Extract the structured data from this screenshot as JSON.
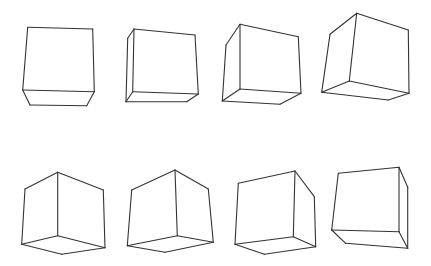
{
  "figure": {
    "background": "#ffffff",
    "line_color": "#333333",
    "rows": 2,
    "columns": 4
  },
  "cubes": [
    {
      "id": 1,
      "row": 1,
      "col": 1,
      "edges": [
        [
          [
            27.7,
            27.3
          ],
          [
            92.7,
            29
          ]
        ],
        [
          [
            27.7,
            27.3
          ],
          [
            22.7,
            90
          ]
        ],
        [
          [
            92.7,
            29
          ],
          [
            94.3,
            91.7
          ]
        ],
        [
          [
            22.7,
            90
          ],
          [
            94.3,
            91.7
          ]
        ],
        [
          [
            22.7,
            90
          ],
          [
            30,
            105
          ]
        ],
        [
          [
            94.3,
            91.7
          ],
          [
            86.7,
            105.7
          ]
        ],
        [
          [
            30,
            105
          ],
          [
            86.7,
            105.7
          ]
        ]
      ]
    },
    {
      "id": 2,
      "row": 1,
      "col": 2,
      "edges": [
        [
          [
            134,
            29
          ],
          [
            195,
            35
          ]
        ],
        [
          [
            134,
            29
          ],
          [
            127.7,
            38.3
          ]
        ],
        [
          [
            134,
            29
          ],
          [
            132.7,
            91.7
          ]
        ],
        [
          [
            195,
            35
          ],
          [
            198.3,
            94
          ]
        ],
        [
          [
            127.7,
            38.3
          ],
          [
            126,
            101.7
          ]
        ],
        [
          [
            132.7,
            91.7
          ],
          [
            198.3,
            94
          ]
        ],
        [
          [
            132.7,
            91.7
          ],
          [
            126,
            101.7
          ]
        ],
        [
          [
            126,
            101.7
          ],
          [
            186.7,
            101.7
          ]
        ],
        [
          [
            198.3,
            94
          ],
          [
            186.7,
            101.7
          ]
        ]
      ]
    },
    {
      "id": 3,
      "row": 1,
      "col": 3,
      "edges": [
        [
          [
            240,
            24.3
          ],
          [
            298.3,
            36.7
          ]
        ],
        [
          [
            240,
            24.3
          ],
          [
            226,
            45
          ]
        ],
        [
          [
            240,
            24.3
          ],
          [
            240,
            89
          ]
        ],
        [
          [
            298.3,
            36.7
          ],
          [
            301,
            93.3
          ]
        ],
        [
          [
            226,
            45
          ],
          [
            222.3,
            101
          ]
        ],
        [
          [
            240,
            89
          ],
          [
            301,
            93.3
          ]
        ],
        [
          [
            240,
            89
          ],
          [
            222.3,
            101
          ]
        ],
        [
          [
            222.3,
            101
          ],
          [
            280,
            104.3
          ]
        ],
        [
          [
            301,
            93.3
          ],
          [
            280,
            104.3
          ]
        ]
      ]
    },
    {
      "id": 4,
      "row": 1,
      "col": 4,
      "edges": [
        [
          [
            356.7,
            13.3
          ],
          [
            408.3,
            30
          ]
        ],
        [
          [
            356.7,
            13.3
          ],
          [
            330,
            34.3
          ]
        ],
        [
          [
            356.7,
            13.3
          ],
          [
            349.3,
            81
          ]
        ],
        [
          [
            408.3,
            30
          ],
          [
            409,
            93.3
          ]
        ],
        [
          [
            330,
            34.3
          ],
          [
            321.7,
            92.3
          ]
        ],
        [
          [
            349.3,
            81
          ],
          [
            409,
            93.3
          ]
        ],
        [
          [
            349.3,
            81
          ],
          [
            321.7,
            92.3
          ]
        ],
        [
          [
            321.7,
            92.3
          ],
          [
            388.3,
            100
          ]
        ],
        [
          [
            409,
            93.3
          ],
          [
            388.3,
            100
          ]
        ]
      ]
    },
    {
      "id": 5,
      "row": 2,
      "col": 1,
      "edges": [
        [
          [
            57.7,
            172.3
          ],
          [
            25,
            189
          ]
        ],
        [
          [
            57.7,
            172.3
          ],
          [
            103.3,
            190
          ]
        ],
        [
          [
            57.7,
            172.3
          ],
          [
            57.7,
            235.7
          ]
        ],
        [
          [
            25,
            189
          ],
          [
            21.7,
            244.3
          ]
        ],
        [
          [
            103.3,
            190
          ],
          [
            105,
            247.7
          ]
        ],
        [
          [
            57.7,
            235.7
          ],
          [
            21.7,
            244.3
          ]
        ],
        [
          [
            57.7,
            235.7
          ],
          [
            105,
            247.7
          ]
        ],
        [
          [
            21.7,
            244.3
          ],
          [
            61.7,
            254.3
          ]
        ],
        [
          [
            105,
            247.7
          ],
          [
            61.7,
            254.3
          ]
        ]
      ]
    },
    {
      "id": 6,
      "row": 2,
      "col": 2,
      "edges": [
        [
          [
            175,
            170
          ],
          [
            131.7,
            190
          ]
        ],
        [
          [
            175,
            170
          ],
          [
            208.3,
            189
          ]
        ],
        [
          [
            175,
            170
          ],
          [
            177.3,
            235.7
          ]
        ],
        [
          [
            131.7,
            190
          ],
          [
            127.3,
            245.7
          ]
        ],
        [
          [
            208.3,
            189
          ],
          [
            213.3,
            242.3
          ]
        ],
        [
          [
            177.3,
            235.7
          ],
          [
            127.3,
            245.7
          ]
        ],
        [
          [
            177.3,
            235.7
          ],
          [
            213.3,
            242.3
          ]
        ],
        [
          [
            127.3,
            245.7
          ],
          [
            165,
            252.3
          ]
        ],
        [
          [
            213.3,
            242.3
          ],
          [
            165,
            252.3
          ]
        ]
      ]
    },
    {
      "id": 7,
      "row": 2,
      "col": 3,
      "edges": [
        [
          [
            295,
            171
          ],
          [
            238.3,
            183.3
          ]
        ],
        [
          [
            295,
            171
          ],
          [
            314.3,
            196.7
          ]
        ],
        [
          [
            295,
            171
          ],
          [
            293.3,
            236.7
          ]
        ],
        [
          [
            238.3,
            183.3
          ],
          [
            235,
            244.3
          ]
        ],
        [
          [
            314.3,
            196.7
          ],
          [
            315.7,
            246.7
          ]
        ],
        [
          [
            293.3,
            236.7
          ],
          [
            235,
            244.3
          ]
        ],
        [
          [
            293.3,
            236.7
          ],
          [
            315.7,
            246.7
          ]
        ],
        [
          [
            235,
            244.3
          ],
          [
            264.3,
            254.3
          ]
        ],
        [
          [
            315.7,
            246.7
          ],
          [
            264.3,
            254.3
          ]
        ]
      ]
    },
    {
      "id": 8,
      "row": 2,
      "col": 4,
      "edges": [
        [
          [
            338.3,
            173.3
          ],
          [
            399,
            167.3
          ]
        ],
        [
          [
            399,
            167.3
          ],
          [
            407.7,
            187.3
          ]
        ],
        [
          [
            338.3,
            173.3
          ],
          [
            331.7,
            230
          ]
        ],
        [
          [
            399,
            167.3
          ],
          [
            399,
            231.7
          ]
        ],
        [
          [
            407.7,
            187.3
          ],
          [
            407.7,
            248.3
          ]
        ],
        [
          [
            331.7,
            230
          ],
          [
            399,
            231.7
          ]
        ],
        [
          [
            331.7,
            230
          ],
          [
            345.7,
            243.3
          ]
        ],
        [
          [
            399,
            231.7
          ],
          [
            407.7,
            248.3
          ]
        ],
        [
          [
            345.7,
            243.3
          ],
          [
            407.7,
            248.3
          ]
        ]
      ]
    }
  ]
}
